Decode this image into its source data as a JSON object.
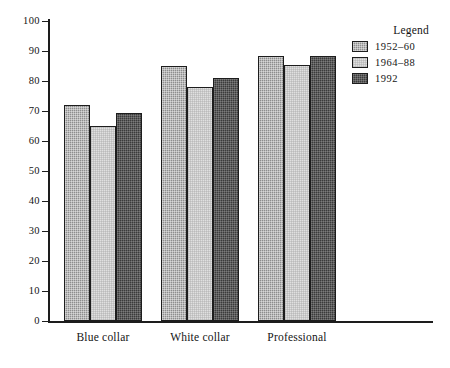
{
  "chart_data": {
    "type": "bar",
    "title": "",
    "subtitle": "",
    "xlabel": "",
    "ylabel": "",
    "ylim": [
      0,
      100
    ],
    "ytick_values": [
      0,
      10,
      20,
      30,
      40,
      50,
      60,
      70,
      80,
      90,
      100
    ],
    "ytick_labels": [
      "0",
      "10",
      "20",
      "30",
      "40",
      "50",
      "60",
      "70",
      "80",
      "90",
      "100"
    ],
    "grid": false,
    "legend_position": "top-right",
    "legend_title": "Legend",
    "categories": [
      "Blue collar",
      "White collar",
      "Professional"
    ],
    "series": [
      {
        "name": "1952–60",
        "color": "#8d8d8d",
        "values": [
          72,
          85,
          88.5
        ]
      },
      {
        "name": "1964–88",
        "color": "#e0e0e0",
        "values": [
          65,
          78,
          85.5
        ]
      },
      {
        "name": "1992",
        "color": "#3b3b3b",
        "values": [
          69.5,
          81,
          88.5
        ]
      }
    ]
  },
  "axes": {
    "y_ticks": [
      {
        "label": "100",
        "value": 100
      },
      {
        "label": "90",
        "value": 90
      },
      {
        "label": "80",
        "value": 80
      },
      {
        "label": "70",
        "value": 70
      },
      {
        "label": "60",
        "value": 60
      },
      {
        "label": "50",
        "value": 50
      },
      {
        "label": "40",
        "value": 40
      },
      {
        "label": "30",
        "value": 30
      },
      {
        "label": "20",
        "value": 20
      },
      {
        "label": "10",
        "value": 10
      },
      {
        "label": "0",
        "value": 0
      }
    ],
    "x_categories": [
      {
        "label": "Blue collar"
      },
      {
        "label": "White collar"
      },
      {
        "label": "Professional"
      }
    ]
  },
  "legend": {
    "title": "Legend",
    "items": [
      {
        "label": "1952–60",
        "swatch": "swatch-a"
      },
      {
        "label": "1964–88",
        "swatch": "swatch-b"
      },
      {
        "label": "1992",
        "swatch": "swatch-c"
      }
    ]
  }
}
